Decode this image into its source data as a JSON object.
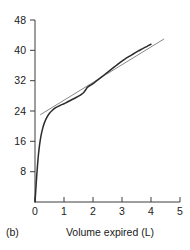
{
  "panel": {
    "label": "(b)"
  },
  "chart_data": {
    "type": "line",
    "title": "",
    "subtitle": "",
    "xlabel": "Volume expired (L)",
    "ylabel": "",
    "xlim": [
      0,
      5
    ],
    "ylim": [
      0,
      48
    ],
    "xticks": [
      0,
      1,
      2,
      3,
      4,
      5
    ],
    "xticklabels": [
      "0",
      "1",
      "2",
      "3",
      "4",
      "5"
    ],
    "yticks": [
      0,
      8,
      16,
      24,
      32,
      40,
      48
    ],
    "yticklabels": [
      "0",
      "8",
      "16",
      "24",
      "32",
      "40",
      "48"
    ],
    "grid": false,
    "legend": null,
    "legend_position": "none",
    "annotations": [
      "(b)"
    ],
    "series": [
      {
        "name": "expiratory curve",
        "style": "solid",
        "color": "#2b2b2b",
        "linewidth": 1.5,
        "x": [
          0.0,
          0.03,
          0.06,
          0.09,
          0.12,
          0.16,
          0.2,
          0.26,
          0.32,
          0.4,
          0.5,
          0.6,
          0.7,
          0.8,
          0.9,
          1.0,
          1.1,
          1.2,
          1.3,
          1.4,
          1.5,
          1.6,
          1.68,
          1.75,
          1.8,
          1.85,
          1.92,
          2.0,
          2.1,
          2.2,
          2.35,
          2.5,
          2.65,
          2.8,
          2.95,
          3.1,
          3.25,
          3.4,
          3.55,
          3.7,
          3.85,
          4.0
        ],
        "y": [
          0.0,
          3.5,
          7.0,
          10.0,
          12.6,
          15.2,
          17.2,
          19.3,
          20.8,
          22.2,
          23.4,
          24.2,
          24.8,
          25.2,
          25.6,
          25.9,
          26.3,
          26.7,
          27.1,
          27.5,
          27.9,
          28.4,
          28.9,
          29.6,
          30.2,
          30.5,
          30.8,
          31.2,
          31.8,
          32.4,
          33.3,
          34.2,
          35.1,
          36.0,
          36.9,
          37.7,
          38.4,
          39.1,
          39.8,
          40.4,
          41.0,
          41.6
        ]
      },
      {
        "name": "reference line",
        "style": "solid",
        "color": "#555555",
        "linewidth": 0.7,
        "x": [
          0.18,
          4.45
        ],
        "y": [
          23.0,
          43.0
        ]
      }
    ]
  }
}
